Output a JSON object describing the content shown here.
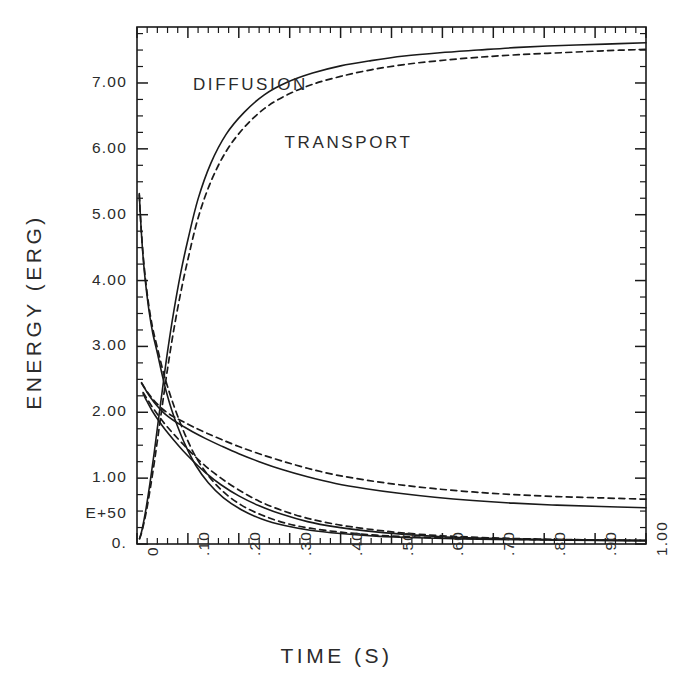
{
  "chart_data": {
    "type": "line",
    "title": "",
    "xlabel": "TIME (S)",
    "ylabel": "ENERGY (ERG)",
    "y_exponent_label": "E+50",
    "xlim": [
      0.0,
      1.0
    ],
    "ylim": [
      0.0,
      7.85
    ],
    "grid": false,
    "legend": "inline-annotations",
    "xticks": [
      0.0,
      0.1,
      0.2,
      0.3,
      0.4,
      0.5,
      0.6,
      0.7,
      0.8,
      0.9,
      1.0
    ],
    "xtick_labels": [
      "0.",
      ".10",
      ".20",
      ".30",
      ".40",
      ".50",
      ".60",
      ".70",
      ".80",
      ".90",
      "1.00"
    ],
    "yticks": [
      0.0,
      1.0,
      2.0,
      3.0,
      4.0,
      5.0,
      6.0,
      7.0
    ],
    "ytick_labels": [
      "0.",
      "1.00",
      "2.00",
      "3.00",
      "4.00",
      "5.00",
      "6.00",
      "7.00"
    ],
    "x_minor_per_major": 5,
    "y_minor_per_major": 4,
    "annotations": [
      {
        "text": "DIFFUSION",
        "x": 0.11,
        "y": 6.95,
        "style": "solid"
      },
      {
        "text": "TRANSPORT",
        "x": 0.29,
        "y": 6.07,
        "style": "dashed"
      }
    ],
    "series": [
      {
        "name": "DIFFUSION",
        "style": "solid",
        "branches": [
          {
            "id": "rising",
            "x": [
              0.005,
              0.01,
              0.018,
              0.026,
              0.034,
              0.042,
              0.05,
              0.06,
              0.072,
              0.086,
              0.1,
              0.12,
              0.145,
              0.175,
              0.21,
              0.25,
              0.295,
              0.345,
              0.4,
              0.46,
              0.525,
              0.595,
              0.67,
              0.75,
              0.835,
              0.92,
              1.0
            ],
            "y": [
              0.08,
              0.22,
              0.55,
              0.95,
              1.4,
              1.88,
              2.35,
              2.92,
              3.52,
              4.12,
              4.62,
              5.24,
              5.78,
              6.22,
              6.55,
              6.82,
              7.01,
              7.15,
              7.26,
              7.34,
              7.41,
              7.46,
              7.5,
              7.54,
              7.57,
              7.59,
              7.61
            ]
          },
          {
            "id": "steep-decay",
            "x": [
              0.0045,
              0.006,
              0.009,
              0.013,
              0.018,
              0.024,
              0.031,
              0.04,
              0.05,
              0.058,
              0.068,
              0.08,
              0.095,
              0.115,
              0.14,
              0.17,
              0.205,
              0.245,
              0.29,
              0.34,
              0.4,
              0.47,
              0.55,
              0.64,
              0.74,
              0.85,
              1.0
            ],
            "y": [
              5.32,
              5.08,
              4.68,
              4.26,
              3.88,
              3.52,
              3.2,
              2.9,
              2.55,
              2.3,
              2.04,
              1.78,
              1.5,
              1.2,
              0.93,
              0.7,
              0.52,
              0.38,
              0.28,
              0.21,
              0.16,
              0.12,
              0.095,
              0.078,
              0.066,
              0.058,
              0.05
            ]
          },
          {
            "id": "mid-decay",
            "x": [
              0.009,
              0.014,
              0.02,
              0.028,
              0.038,
              0.05,
              0.062,
              0.075,
              0.09,
              0.11,
              0.135,
              0.165,
              0.2,
              0.24,
              0.285,
              0.335,
              0.39,
              0.45,
              0.515,
              0.585,
              0.66,
              0.74,
              0.825,
              0.912,
              1.0
            ],
            "y": [
              2.45,
              2.38,
              2.3,
              2.21,
              2.11,
              2.01,
              1.93,
              1.86,
              1.79,
              1.7,
              1.6,
              1.49,
              1.37,
              1.25,
              1.13,
              1.02,
              0.92,
              0.84,
              0.77,
              0.71,
              0.66,
              0.62,
              0.59,
              0.57,
              0.55
            ]
          },
          {
            "id": "low-decay",
            "x": [
              0.012,
              0.02,
              0.03,
              0.042,
              0.056,
              0.072,
              0.09,
              0.11,
              0.135,
              0.165,
              0.2,
              0.24,
              0.285,
              0.335,
              0.39,
              0.45,
              0.52,
              0.6,
              0.69,
              0.79,
              0.895,
              1.0
            ],
            "y": [
              2.28,
              2.16,
              2.02,
              1.88,
              1.73,
              1.58,
              1.42,
              1.26,
              1.08,
              0.9,
              0.73,
              0.58,
              0.45,
              0.34,
              0.26,
              0.2,
              0.15,
              0.11,
              0.085,
              0.068,
              0.058,
              0.052
            ]
          }
        ]
      },
      {
        "name": "TRANSPORT",
        "style": "dashed",
        "branches": [
          {
            "id": "rising",
            "x": [
              0.005,
              0.01,
              0.018,
              0.026,
              0.034,
              0.042,
              0.05,
              0.06,
              0.072,
              0.086,
              0.1,
              0.12,
              0.145,
              0.175,
              0.21,
              0.25,
              0.295,
              0.345,
              0.4,
              0.46,
              0.525,
              0.595,
              0.67,
              0.75,
              0.835,
              0.92,
              1.0
            ],
            "y": [
              0.08,
              0.2,
              0.48,
              0.84,
              1.24,
              1.68,
              2.12,
              2.66,
              3.24,
              3.82,
              4.32,
              4.95,
              5.5,
              5.96,
              6.32,
              6.61,
              6.82,
              6.98,
              7.1,
              7.2,
              7.28,
              7.34,
              7.39,
              7.43,
              7.46,
              7.49,
              7.51
            ]
          },
          {
            "id": "steep-decay",
            "x": [
              0.0045,
              0.006,
              0.009,
              0.013,
              0.018,
              0.024,
              0.031,
              0.04,
              0.05,
              0.058,
              0.068,
              0.08,
              0.095,
              0.115,
              0.14,
              0.17,
              0.205,
              0.245,
              0.29,
              0.34,
              0.4,
              0.47,
              0.55,
              0.64,
              0.74,
              0.85,
              1.0
            ],
            "y": [
              5.3,
              5.07,
              4.7,
              4.3,
              3.93,
              3.58,
              3.27,
              2.98,
              2.66,
              2.44,
              2.2,
              1.94,
              1.65,
              1.33,
              1.04,
              0.79,
              0.59,
              0.44,
              0.32,
              0.24,
              0.18,
              0.135,
              0.105,
              0.085,
              0.072,
              0.062,
              0.054
            ]
          },
          {
            "id": "mid-decay",
            "x": [
              0.009,
              0.014,
              0.02,
              0.028,
              0.038,
              0.05,
              0.062,
              0.075,
              0.09,
              0.11,
              0.135,
              0.165,
              0.2,
              0.24,
              0.285,
              0.335,
              0.39,
              0.45,
              0.515,
              0.585,
              0.66,
              0.74,
              0.825,
              0.912,
              1.0
            ],
            "y": [
              2.44,
              2.38,
              2.31,
              2.23,
              2.14,
              2.05,
              1.98,
              1.92,
              1.86,
              1.78,
              1.69,
              1.59,
              1.48,
              1.37,
              1.26,
              1.15,
              1.05,
              0.97,
              0.9,
              0.84,
              0.79,
              0.75,
              0.72,
              0.7,
              0.68
            ]
          },
          {
            "id": "low-decay",
            "x": [
              0.012,
              0.02,
              0.03,
              0.042,
              0.056,
              0.072,
              0.09,
              0.11,
              0.135,
              0.165,
              0.2,
              0.24,
              0.285,
              0.335,
              0.39,
              0.45,
              0.52,
              0.6,
              0.69,
              0.79,
              0.895,
              1.0
            ],
            "y": [
              2.3,
              2.2,
              2.08,
              1.95,
              1.81,
              1.67,
              1.52,
              1.36,
              1.18,
              1.0,
              0.82,
              0.65,
              0.51,
              0.39,
              0.3,
              0.23,
              0.17,
              0.125,
              0.095,
              0.075,
              0.062,
              0.055
            ]
          }
        ]
      }
    ],
    "colors": {
      "line": "#1a1a1a",
      "axis": "#1a1a1a",
      "text": "#2b2b2b",
      "background": "#ffffff"
    }
  },
  "plot_box": {
    "left": 137,
    "top": 27,
    "right": 646,
    "bottom": 544
  }
}
